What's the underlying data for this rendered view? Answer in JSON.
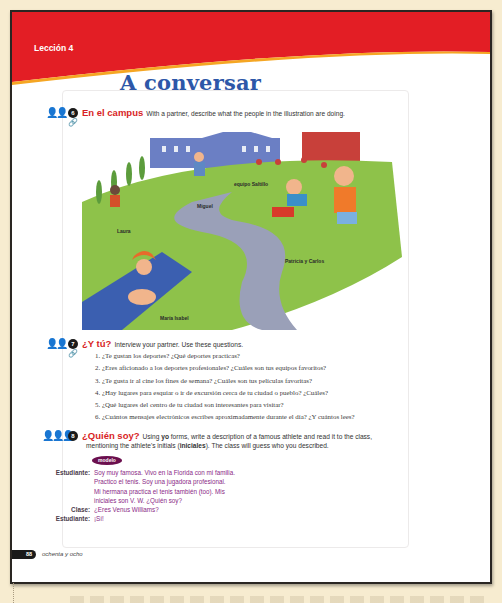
{
  "header": {
    "lesson_label": "Lección 4",
    "section_title": "A conversar",
    "banner_color": "#e31e25"
  },
  "activities": [
    {
      "number": "6",
      "title": "En el campus",
      "description": "With a partner, describe what the people in the illustration are doing.",
      "icon": "pair-icon",
      "resource_icon": "link-icon",
      "illustration": {
        "labels": [
          "equipo Saltillo",
          "Miguel",
          "Laura",
          "Patricia y Carlos",
          "María Isabel"
        ]
      }
    },
    {
      "number": "7",
      "title": "¿Y tú?",
      "description": "Interview your partner. Use these questions.",
      "icon": "pair-icon",
      "resource_icon": "link-icon",
      "questions": [
        "1. ¿Te gustan los deportes? ¿Qué deportes practicas?",
        "2. ¿Eres aficionado a los deportes profesionales? ¿Cuáles son tus equipos favoritos?",
        "3. ¿Te gusta ir al cine los fines de semana? ¿Cuáles son tus películas favoritas?",
        "4. ¿Hay lugares para esquiar o ir de excursión cerca de tu ciudad o pueblo? ¿Cuáles?",
        "5. ¿Qué lugares del centro de tu ciudad son interesantes para visitar?",
        "6. ¿Cuántos mensajes electrónicos escribes aproximadamente durante el día? ¿Y cuántos lees?"
      ]
    },
    {
      "number": "8",
      "title": "¿Quién soy?",
      "description_pre": "Using ",
      "description_bold1": "yo",
      "description_mid": " forms, write a description of a famous athlete and read it to the class,",
      "description_line2_pre": "mentioning the athlete's initials (",
      "description_bold2": "iniciales",
      "description_line2_post": "). The class will guess who you described.",
      "icon": "group-icon",
      "model_label": "modelo",
      "dialog": [
        {
          "speaker": "Estudiante:",
          "text": "Soy muy famosa. Vivo en la Florida con mi familia."
        },
        {
          "speaker": "",
          "text": "Practico el tenis. Soy una jugadora profesional."
        },
        {
          "speaker": "",
          "text": "Mi hermana practica el tenis también (too). Mis"
        },
        {
          "speaker": "",
          "text": "iniciales son V. W. ¿Quién soy?"
        },
        {
          "speaker": "Clase:",
          "text": "¿Eres Venus Williams?"
        },
        {
          "speaker": "Estudiante:",
          "text": "¡Sí!"
        }
      ]
    }
  ],
  "footer": {
    "page_number": "88",
    "page_words": "ochenta y ocho"
  },
  "colors": {
    "title_blue": "#2d57a8",
    "activity_red": "#d81f26",
    "model_purple": "#6b0f4e",
    "dialog_text": "#8b2a86",
    "background": "#f7ecd0"
  }
}
